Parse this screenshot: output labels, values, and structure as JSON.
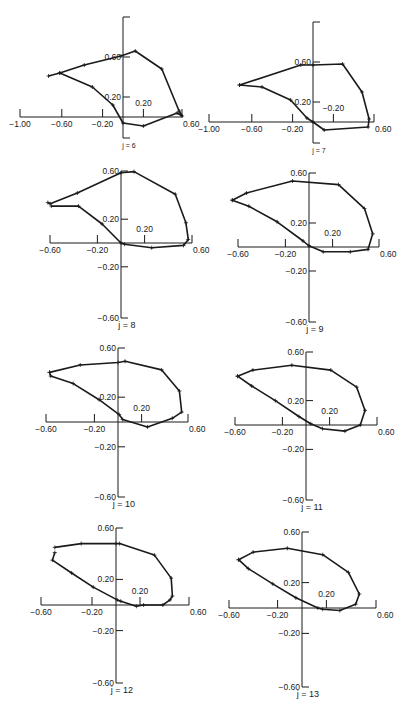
{
  "figure": {
    "line_color": "#1a1a1a",
    "marker": "+"
  },
  "chart_data": [
    {
      "type": "line",
      "title": "j = 6",
      "label": "j = 6",
      "xticks": [
        -1.0,
        -0.6,
        -0.2,
        0.2,
        0.6
      ],
      "xtick_labels": [
        "−1.00",
        "−0.60",
        "−0.20",
        "0.20",
        "0.60"
      ],
      "yticks": [
        0.2,
        0.6
      ],
      "ytick_labels": [
        "0.20",
        "0.60"
      ],
      "xlim": [
        -1.0,
        0.6
      ],
      "ylim": [
        -0.2,
        0.95
      ],
      "frame": {
        "ox": 123,
        "oy": 117,
        "sx": 102,
        "sy": 100,
        "ytop": 17,
        "ybot": 138,
        "xleft": 20,
        "xright": 182
      },
      "x": [
        -0.73,
        -0.62,
        -0.38,
        -0.02,
        0.12,
        0.38,
        0.55,
        0.58,
        0.53,
        0.2,
        0.0,
        -0.1,
        -0.3,
        -0.62
      ],
      "y": [
        0.41,
        0.44,
        0.52,
        0.61,
        0.66,
        0.48,
        0.06,
        0.01,
        0.04,
        -0.09,
        -0.06,
        0.12,
        0.3,
        0.44
      ]
    },
    {
      "type": "line",
      "title": "j = 7",
      "label": "j = 7",
      "xticks": [
        -1.0,
        -0.6,
        -0.2,
        0.2,
        0.6
      ],
      "xtick_labels": [
        "−1.00",
        "−0.60",
        "−0.20",
        "−0.20",
        "0.60"
      ],
      "yticks": [
        0.2,
        0.6
      ],
      "ytick_labels": [
        "0.20",
        "0.60"
      ],
      "xlim": [
        -1.0,
        0.6
      ],
      "ylim": [
        -0.2,
        0.95
      ],
      "frame": {
        "ox": 313,
        "oy": 122,
        "sx": 102,
        "sy": 100,
        "ytop": 22,
        "ybot": 143,
        "xleft": 209,
        "xright": 374
      },
      "x": [
        -0.72,
        -0.12,
        0.0,
        0.29,
        0.48,
        0.55,
        0.54,
        0.11,
        0.0,
        -0.06,
        -0.22,
        -0.5,
        -0.72
      ],
      "y": [
        0.37,
        0.57,
        0.57,
        0.58,
        0.3,
        0.03,
        -0.05,
        -0.08,
        0.0,
        0.04,
        0.22,
        0.35,
        0.37
      ]
    },
    {
      "type": "line",
      "title": "j = 8",
      "label": "j = 8",
      "xticks": [
        -0.6,
        -0.2,
        0.2,
        0.6
      ],
      "xtick_labels": [
        "−0.60",
        "−0.20",
        "0.20",
        "0.60"
      ],
      "yticks": [
        0.6,
        0.2,
        -0.2,
        -0.6
      ],
      "ytick_labels": [
        "0.60",
        "0.20",
        "−0.20",
        "−0.60"
      ],
      "xlim": [
        -0.6,
        0.6
      ],
      "ylim": [
        -0.6,
        0.6
      ],
      "frame": {
        "ox": 121,
        "oy": 243,
        "sx": 118,
        "sy": 119,
        "ytop": 171,
        "ybot": 318,
        "xleft": 50,
        "xright": 192
      },
      "x": [
        -0.62,
        -0.6,
        -0.37,
        0.0,
        0.11,
        0.46,
        0.55,
        0.57,
        0.53,
        0.26,
        0.03,
        0.0,
        -0.16,
        -0.36,
        -0.59
      ],
      "y": [
        0.34,
        0.33,
        0.42,
        0.59,
        0.6,
        0.41,
        0.17,
        0.03,
        -0.02,
        -0.04,
        -0.01,
        0.0,
        0.16,
        0.31,
        0.31
      ]
    },
    {
      "type": "line",
      "title": "j = 9",
      "label": "j = 9",
      "xticks": [
        -0.6,
        -0.2,
        0.2,
        0.6
      ],
      "xtick_labels": [
        "−0.60",
        "−0.20",
        "0.20",
        "0.60"
      ],
      "yticks": [
        0.6,
        0.2,
        -0.2,
        -0.6
      ],
      "ytick_labels": [
        "0.60",
        "0.20",
        "−0.20",
        "−0.60"
      ],
      "xlim": [
        -0.6,
        0.6
      ],
      "ylim": [
        -0.6,
        0.6
      ],
      "frame": {
        "ox": 309,
        "oy": 247,
        "sx": 118,
        "sy": 120,
        "ytop": 173,
        "ybot": 322,
        "xleft": 238,
        "xright": 379
      },
      "x": [
        -0.65,
        -0.53,
        -0.14,
        0.25,
        0.47,
        0.54,
        0.5,
        0.35,
        0.12,
        0.0,
        -0.05,
        -0.27,
        -0.51,
        -0.65
      ],
      "y": [
        0.39,
        0.45,
        0.55,
        0.52,
        0.32,
        0.11,
        -0.02,
        -0.04,
        -0.04,
        0.01,
        0.05,
        0.21,
        0.34,
        0.39
      ]
    },
    {
      "type": "line",
      "title": "j = 10",
      "label": "j = 10",
      "xticks": [
        -0.6,
        -0.2,
        0.2,
        0.6
      ],
      "xtick_labels": [
        "−0.60",
        "−0.20",
        "0.20",
        "0.60"
      ],
      "yticks": [
        0.6,
        0.2,
        -0.2,
        -0.6
      ],
      "ytick_labels": [
        "0.60",
        "0.20",
        "−0.20",
        "−0.60"
      ],
      "xlim": [
        -0.6,
        0.6
      ],
      "ylim": [
        -0.6,
        0.6
      ],
      "frame": {
        "ox": 118,
        "oy": 422,
        "sx": 118,
        "sy": 124,
        "ytop": 348,
        "ybot": 497,
        "xleft": 46,
        "xright": 188
      },
      "x": [
        -0.58,
        -0.32,
        0.0,
        0.06,
        0.37,
        0.52,
        0.54,
        0.46,
        0.25,
        0.04,
        0.01,
        -0.16,
        -0.38,
        -0.57,
        -0.58
      ],
      "y": [
        0.4,
        0.46,
        0.48,
        0.49,
        0.42,
        0.25,
        0.08,
        0.03,
        -0.04,
        0.02,
        0.06,
        0.18,
        0.31,
        0.37,
        0.4
      ]
    },
    {
      "type": "line",
      "title": "j = 11",
      "label": "j = 11",
      "xticks": [
        -0.6,
        -0.2,
        0.2,
        0.6
      ],
      "xtick_labels": [
        "−0.60",
        "−0.20",
        "0.20",
        "0.60"
      ],
      "yticks": [
        0.6,
        0.2,
        -0.2,
        -0.6
      ],
      "ytick_labels": [
        "0.60",
        "0.20",
        "−0.20",
        "−0.60"
      ],
      "xlim": [
        -0.6,
        0.6
      ],
      "ylim": [
        -0.6,
        0.6
      ],
      "frame": {
        "ox": 306,
        "oy": 425,
        "sx": 118,
        "sy": 122,
        "ytop": 352,
        "ybot": 500,
        "xleft": 235,
        "xright": 377
      },
      "x": [
        -0.58,
        -0.45,
        -0.12,
        0.21,
        0.43,
        0.5,
        0.46,
        0.33,
        0.14,
        0.04,
        -0.06,
        -0.26,
        -0.46,
        -0.58
      ],
      "y": [
        0.4,
        0.45,
        0.49,
        0.45,
        0.31,
        0.12,
        0.0,
        -0.05,
        -0.03,
        0.01,
        0.07,
        0.2,
        0.32,
        0.4
      ]
    },
    {
      "type": "line",
      "title": "j = 12",
      "label": "j = 12",
      "xticks": [
        -0.6,
        -0.2,
        0.2,
        0.6
      ],
      "xtick_labels": [
        "−0.60",
        "−0.20",
        "0.20",
        "0.60"
      ],
      "yticks": [
        0.6,
        0.2,
        -0.2,
        -0.6
      ],
      "ytick_labels": [
        "0.60",
        "0.20",
        "−0.20",
        "−0.60"
      ],
      "xlim": [
        -0.6,
        0.6
      ],
      "ylim": [
        -0.6,
        0.6
      ],
      "frame": {
        "ox": 116,
        "oy": 605,
        "sx": 120,
        "sy": 128,
        "ytop": 528,
        "ybot": 683,
        "xleft": 41,
        "xright": 189
      },
      "x": [
        -0.51,
        -0.29,
        0.0,
        0.03,
        0.32,
        0.46,
        0.47,
        0.45,
        0.39,
        0.23,
        0.17,
        0.04,
        0.01,
        -0.19,
        -0.37,
        -0.53,
        -0.51
      ],
      "y": [
        0.45,
        0.48,
        0.48,
        0.48,
        0.39,
        0.21,
        0.07,
        0.04,
        0.0,
        0.0,
        -0.01,
        0.03,
        0.04,
        0.14,
        0.25,
        0.35,
        0.41
      ]
    },
    {
      "type": "line",
      "title": "j = 13",
      "label": "j = 13",
      "xticks": [
        -0.6,
        -0.2,
        0.2,
        0.6
      ],
      "xtick_labels": [
        "−0.60",
        "−0.20",
        "0.20",
        "0.60"
      ],
      "yticks": [
        0.6,
        0.2,
        -0.2,
        -0.6
      ],
      "ytick_labels": [
        "0.60",
        "0.20",
        "−0.20",
        "−0.60"
      ],
      "xlim": [
        -0.6,
        0.6
      ],
      "ylim": [
        -0.6,
        0.6
      ],
      "frame": {
        "ox": 302,
        "oy": 608,
        "sx": 122,
        "sy": 127,
        "ytop": 532,
        "ybot": 687,
        "xleft": 229,
        "xright": 376
      },
      "x": [
        -0.52,
        -0.4,
        -0.12,
        0.17,
        0.38,
        0.47,
        0.44,
        0.31,
        0.17,
        0.13,
        -0.05,
        -0.24,
        -0.44,
        -0.52
      ],
      "y": [
        0.38,
        0.44,
        0.47,
        0.42,
        0.28,
        0.11,
        0.03,
        -0.02,
        -0.01,
        0.0,
        0.08,
        0.19,
        0.31,
        0.38
      ]
    }
  ]
}
